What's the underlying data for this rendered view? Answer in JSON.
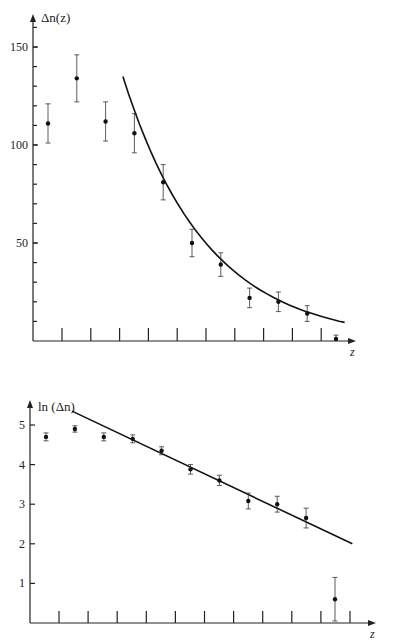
{
  "chart_data": [
    {
      "type": "scatter",
      "title": "",
      "ylabel": "Δn(z)",
      "xlabel": "z",
      "ylim": [
        0,
        160
      ],
      "yticks_labeled": [
        50,
        100,
        150
      ],
      "yminor_step": 10,
      "x_tick_count": 10,
      "series": [
        {
          "name": "data",
          "x": [
            1,
            2,
            3,
            4,
            5,
            6,
            7,
            8,
            9,
            10,
            11
          ],
          "y": [
            111,
            134,
            112,
            106,
            81,
            50,
            39,
            22,
            20,
            14,
            1
          ],
          "err": [
            10,
            12,
            10,
            10,
            9,
            7,
            6,
            5,
            5,
            4,
            2
          ]
        },
        {
          "name": "exponential fit",
          "type": "line",
          "x_range": [
            3.6,
            11.3
          ],
          "y_start": 135,
          "decay": 0.345
        }
      ],
      "grid": false
    },
    {
      "type": "scatter",
      "title": "",
      "ylabel": "ln (Δn)",
      "xlabel": "z",
      "ylim": [
        0,
        5.6
      ],
      "yticks_labeled": [
        1,
        2,
        3,
        4,
        5
      ],
      "x_tick_count": 11,
      "series": [
        {
          "name": "data",
          "x": [
            1,
            2,
            3,
            4,
            5,
            6,
            7,
            8,
            9,
            10,
            11
          ],
          "y": [
            4.7,
            4.9,
            4.7,
            4.65,
            4.35,
            3.88,
            3.6,
            3.08,
            3.0,
            2.65,
            0.6
          ],
          "err": [
            0.1,
            0.08,
            0.1,
            0.1,
            0.1,
            0.12,
            0.13,
            0.2,
            0.2,
            0.25,
            0.55
          ]
        },
        {
          "name": "linear fit",
          "type": "line",
          "x_range": [
            1.9,
            11.6
          ],
          "y_range": [
            5.35,
            2.0
          ]
        }
      ],
      "grid": false
    }
  ]
}
